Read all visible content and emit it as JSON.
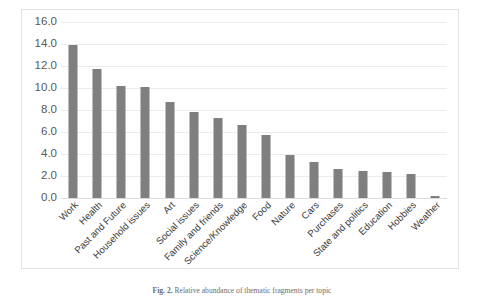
{
  "figure": {
    "caption_label": "Fig. 2.",
    "caption_text": "Relative abundance of thematic fragments per topic"
  },
  "chart_data": {
    "type": "bar",
    "title": "",
    "xlabel": "",
    "ylabel": "",
    "ylim": [
      0,
      16
    ],
    "grid": true,
    "legend": "none",
    "bar_color": "#7f7f7f",
    "gridline_color": "#ebebeb",
    "border_color": "#e2e2e2",
    "ytick_labels": [
      "16.0",
      "14.0",
      "12.0",
      "10.0",
      "8.0",
      "6.0",
      "4.0",
      "2.0",
      "0.0"
    ],
    "ytick_values": [
      16.0,
      14.0,
      12.0,
      10.0,
      8.0,
      6.0,
      4.0,
      2.0,
      0.0
    ],
    "categories": [
      "Work",
      "Health",
      "Past and Future",
      "Household issues",
      "Art",
      "Social issues",
      "Family and friends",
      "Science/Knowledge",
      "Food",
      "Nature",
      "Cars",
      "Purchases",
      "State and politics",
      "Education",
      "Hobbies",
      "Weather"
    ],
    "values": [
      13.9,
      11.7,
      10.15,
      10.05,
      8.7,
      7.85,
      7.25,
      6.6,
      5.75,
      3.9,
      3.25,
      2.6,
      2.5,
      2.4,
      2.15,
      0.2
    ]
  }
}
